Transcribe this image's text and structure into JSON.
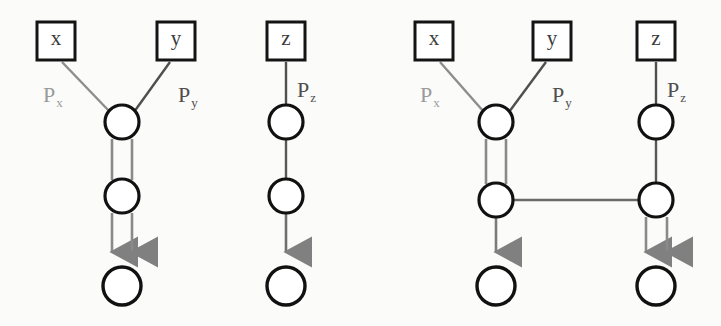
{
  "figure": {
    "width": 721,
    "height": 326,
    "background": "#fbfbfa",
    "colors": {
      "node_stroke": "#111111",
      "box_stroke": "#141414",
      "edge_gray": "#7f7f7f",
      "edge_dark": "#4a4a4a",
      "arrow_gray": "#808080",
      "label_gray": "#9a9a9a",
      "label_dark": "#4e4e4e",
      "node_fill": "#ffffff"
    },
    "groups": [
      {
        "id": "group-1",
        "name": "left-net",
        "places": [
          {
            "name": "input-place-x",
            "shape": "square",
            "label": "x",
            "cx": 56,
            "cy": 41,
            "size": 38
          },
          {
            "name": "input-place-y",
            "shape": "square",
            "label": "y",
            "cx": 176,
            "cy": 41,
            "size": 38
          },
          {
            "name": "transition-top",
            "shape": "circle",
            "cx": 122,
            "cy": 122,
            "r": 17
          },
          {
            "name": "transition-middle",
            "shape": "circle",
            "cx": 122,
            "cy": 196,
            "r": 17
          },
          {
            "name": "transition-bottom",
            "shape": "circle",
            "cx": 122,
            "cy": 286,
            "r": 19
          }
        ],
        "edges": [
          {
            "name": "edge-x-to-top",
            "kind": "diagonal",
            "label": "P",
            "sub": "x",
            "label_color": "label_gray",
            "stroke": "edge_gray"
          },
          {
            "name": "edge-y-to-top",
            "kind": "diagonal",
            "label": "P",
            "sub": "y",
            "label_color": "label_dark",
            "stroke": "edge_dark"
          },
          {
            "name": "edge-top-to-bottom-pair",
            "kind": "double-vertical",
            "arrowheads": 2
          }
        ]
      },
      {
        "id": "group-2",
        "name": "middle-net",
        "places": [
          {
            "name": "input-place-z",
            "shape": "square",
            "label": "z",
            "cx": 286,
            "cy": 41,
            "size": 38
          },
          {
            "name": "transition-top",
            "shape": "circle",
            "cx": 286,
            "cy": 122,
            "r": 17
          },
          {
            "name": "transition-middle",
            "shape": "circle",
            "cx": 286,
            "cy": 196,
            "r": 17
          },
          {
            "name": "transition-bottom",
            "shape": "circle",
            "cx": 286,
            "cy": 286,
            "r": 19
          }
        ],
        "edges": [
          {
            "name": "edge-z-to-top",
            "kind": "vertical",
            "label": "P",
            "sub": "z",
            "label_color": "label_dark",
            "stroke": "edge_dark"
          },
          {
            "name": "edge-top-to-bottom-single",
            "kind": "single-vertical",
            "arrowheads": 1
          }
        ]
      },
      {
        "id": "group-3",
        "name": "right-combined-net",
        "places": [
          {
            "name": "input-place-x",
            "shape": "square",
            "label": "x",
            "cx": 434,
            "cy": 41,
            "size": 38
          },
          {
            "name": "input-place-y",
            "shape": "square",
            "label": "y",
            "cx": 552,
            "cy": 41,
            "size": 38
          },
          {
            "name": "input-place-z",
            "shape": "square",
            "label": "z",
            "cx": 656,
            "cy": 41,
            "size": 38
          },
          {
            "name": "transition-left-top",
            "shape": "circle",
            "cx": 496,
            "cy": 122,
            "r": 17
          },
          {
            "name": "transition-left-middle",
            "shape": "circle",
            "cx": 496,
            "cy": 200,
            "r": 17
          },
          {
            "name": "transition-left-bottom",
            "shape": "circle",
            "cx": 496,
            "cy": 286,
            "r": 19
          },
          {
            "name": "transition-right-top",
            "shape": "circle",
            "cx": 656,
            "cy": 122,
            "r": 17
          },
          {
            "name": "transition-right-middle",
            "shape": "circle",
            "cx": 656,
            "cy": 200,
            "r": 17
          },
          {
            "name": "transition-right-bottom",
            "shape": "circle",
            "cx": 656,
            "cy": 286,
            "r": 19
          }
        ],
        "edges": [
          {
            "name": "edge-x-to-left-top",
            "kind": "diagonal",
            "label": "P",
            "sub": "x",
            "label_color": "label_gray",
            "stroke": "edge_gray"
          },
          {
            "name": "edge-y-to-left-top",
            "kind": "diagonal",
            "label": "P",
            "sub": "y",
            "label_color": "label_dark",
            "stroke": "edge_dark"
          },
          {
            "name": "edge-z-to-right-top",
            "kind": "vertical",
            "label": "P",
            "sub": "z",
            "label_color": "label_dark",
            "stroke": "edge_dark"
          },
          {
            "name": "edge-left-top-to-middle-pair",
            "kind": "double-vertical",
            "arrowheads": 0
          },
          {
            "name": "edge-right-top-to-middle-single",
            "kind": "single-vertical",
            "arrowheads": 0
          },
          {
            "name": "edge-left-middle-to-right-middle",
            "kind": "horizontal",
            "arrowheads": 0
          },
          {
            "name": "edge-left-middle-to-bottom",
            "kind": "single-vertical",
            "arrowheads": 1
          },
          {
            "name": "edge-right-middle-to-bottom-pair",
            "kind": "double-vertical",
            "arrowheads": 2
          }
        ]
      }
    ],
    "labels": {
      "g1_px": {
        "text": "P",
        "sub": "x",
        "x": 43,
        "y": 84,
        "color": "#9a9a9a"
      },
      "g1_py": {
        "text": "P",
        "sub": "y",
        "x": 178,
        "y": 84,
        "color": "#4e4e4e"
      },
      "g2_pz": {
        "text": "P",
        "sub": "z",
        "x": 297,
        "y": 79,
        "color": "#4e4e4e"
      },
      "g3_px": {
        "text": "P",
        "sub": "x",
        "x": 420,
        "y": 84,
        "color": "#9a9a9a"
      },
      "g3_py": {
        "text": "P",
        "sub": "y",
        "x": 552,
        "y": 84,
        "color": "#4e4e4e"
      },
      "g3_pz": {
        "text": "P",
        "sub": "z",
        "x": 667,
        "y": 79,
        "color": "#4e4e4e"
      }
    },
    "box_labels": {
      "g1_x": "x",
      "g1_y": "y",
      "g2_z": "z",
      "g3_x": "x",
      "g3_y": "y",
      "g3_z": "z"
    }
  }
}
